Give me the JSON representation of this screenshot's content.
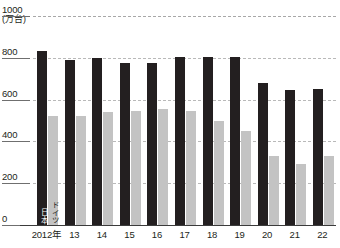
{
  "chart_data": {
    "type": "bar",
    "title": "",
    "subtitle": "",
    "xlabel": "",
    "ylabel": "",
    "unit_label": "(万台)",
    "ylim": [
      0,
      1000
    ],
    "ytick_values": [
      0,
      200,
      400,
      600,
      800,
      1000
    ],
    "ytick_labels": [
      "0",
      "200",
      "400",
      "600",
      "800",
      "1000"
    ],
    "grid": true,
    "legend_position": "inline-first-bars",
    "categories": [
      "2012年",
      "13",
      "14",
      "15",
      "16",
      "17",
      "18",
      "19",
      "20",
      "21",
      "22"
    ],
    "series": [
      {
        "name": "日本",
        "color": "#231f20",
        "values": [
          835,
          790,
          800,
          775,
          775,
          805,
          805,
          805,
          680,
          645,
          650
        ]
      },
      {
        "name": "ドイツ",
        "color": "#c3c3c3",
        "values": [
          520,
          520,
          540,
          545,
          555,
          545,
          500,
          450,
          330,
          290,
          330
        ]
      }
    ]
  }
}
